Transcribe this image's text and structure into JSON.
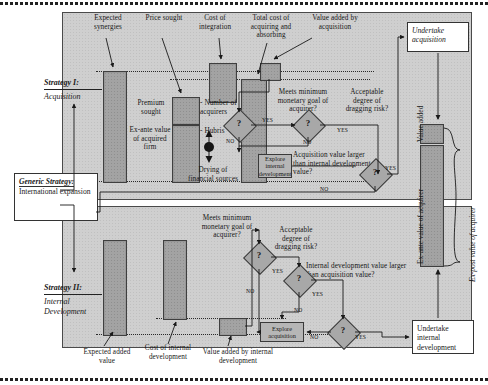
{
  "figure": {
    "generic_strategy": {
      "title": "Generic Strategy:",
      "value": "International expansion"
    },
    "strategy1": {
      "label": "Strategy I:",
      "name": "Acquisition"
    },
    "strategy2": {
      "label": "Strategy II:",
      "name": "Internal Development"
    },
    "top_panel": {
      "bar_labels": [
        "Expected synergies",
        "Price sought",
        "Cost of integration",
        "Total cost of acquiring and absorbing",
        "Value added by acquisition"
      ],
      "inner_labels": [
        "Premium sought",
        "Ex-ante value of acquired firm",
        "- Number of acquirers",
        "- Hubris",
        "Drying of financial sources"
      ],
      "decisions": [
        "Meets minimum monetary goal of acquirer?",
        "Acceptable degree of dragging risk?",
        "Acquisition value larger than internal development value?"
      ],
      "process_box": "Explore internal development",
      "diamond_glyph": "?",
      "yes": "YES",
      "no": "NO"
    },
    "bottom_panel": {
      "bar_labels": [
        "Expected added value",
        "Cost of internal development",
        "Value added by internal development"
      ],
      "decisions": [
        "Meets minimum monetary goal of acquirer?",
        "Acceptable degree of dragging risk?",
        "Internal development value larger than acquisition value?"
      ],
      "process_box": "Explore acquisition",
      "diamond_glyph": "?",
      "yes": "YES",
      "no": "NO"
    },
    "outcomes": {
      "acquisition": "Undertake acquisition",
      "internal": "Undertake internal development"
    },
    "value_axis": {
      "value_added": "Value added",
      "ex_ante": "Ex-ante value of acquirer",
      "ex_post": "Ex-post value of acquirer"
    }
  }
}
